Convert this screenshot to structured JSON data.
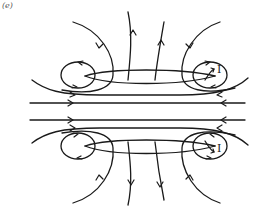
{
  "figure": {
    "panel_label": "(e)",
    "current_labels": {
      "upper": "I",
      "lower": "I"
    },
    "colors": {
      "line": "#1a1a1a",
      "background": "#ffffff",
      "label": "#555555"
    }
  }
}
